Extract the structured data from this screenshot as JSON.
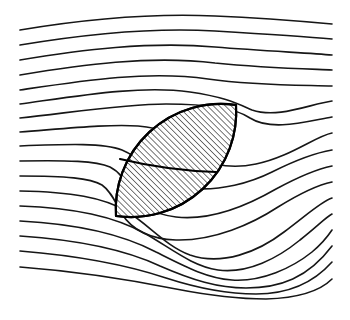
{
  "figure": {
    "title": "Streamlines deflected around an inclined hatched lens-shaped inclusion",
    "caption": "",
    "width_px": 350,
    "height_px": 320,
    "background_color": "#ffffff",
    "line_color": "#161616",
    "outline_color": "#000000",
    "hatch_color": "#141414"
  },
  "chart_data": {
    "type": "line",
    "title": "Streamlines deflected around an inclined hatched lens-shaped inclusion",
    "subtitle": "",
    "xlabel": "",
    "ylabel": "",
    "xlim": [
      0,
      350
    ],
    "ylim": [
      0,
      320
    ],
    "grid": false,
    "legend": false,
    "legend_position": "none",
    "axis_ticks": [],
    "annotations": [],
    "obstacle": {
      "name": "hatched-lens-inclusion",
      "shape": "lens (two circular arcs) inclined about 55 degrees from horizontal",
      "fill_pattern": "45-degree diagonal hatching, descending left-to-right",
      "hatch_angle_deg": -45,
      "hatch_spacing_px": 4.2,
      "tip_lower_left": [
        116,
        216
      ],
      "tip_upper_right": [
        236,
        105
      ],
      "internal_chord_from": [
        120,
        159
      ],
      "internal_chord_to": [
        216,
        172
      ]
    },
    "series": [
      {
        "name": "streamline-1",
        "left_y": 30,
        "right_y": 24,
        "path": "M 20,30 C 80,20 150,13 215,16 C 265,18 310,22 332,24"
      },
      {
        "name": "streamline-2",
        "left_y": 45,
        "right_y": 39,
        "path": "M 20,45 C 80,35 150,27 215,31 C 265,34 310,37 332,39"
      },
      {
        "name": "streamline-3",
        "left_y": 60,
        "right_y": 55,
        "path": "M 20,60 C 80,50 150,41 215,47 C 265,51 310,53 332,55"
      },
      {
        "name": "streamline-4",
        "left_y": 75,
        "right_y": 70,
        "path": "M 20,75 C 80,65 150,55 215,63 C 265,68 310,69 332,70"
      },
      {
        "name": "streamline-5",
        "left_y": 90,
        "right_y": 86,
        "path": "M 20,90 C 80,81 148,70 208,79 C 258,86 308,85 332,86"
      },
      {
        "name": "streamline-6",
        "left_y": 104,
        "right_y": 101,
        "path": "M 20,104 C 78,96 140,85 190,92 C 225,97 238,104 252,110 C 278,119 310,104 332,101"
      },
      {
        "name": "streamline-7",
        "left_y": 118,
        "right_y": 117,
        "path": "M 20,118 C 75,112 126,104 166,104 C 200,104 234,107 250,118 C 272,132 308,121 332,117"
      },
      {
        "name": "streamline-8",
        "left_y": 132,
        "right_y": 133,
        "path": "M 20,132 C 72,128 110,124 138,126 C 162,128 178,135 186,146 C 200,164 228,170 256,164 C 290,157 316,136 332,133"
      },
      {
        "name": "streamline-9",
        "left_y": 146,
        "right_y": 150,
        "path": "M 20,146 C 70,144 104,143 122,150 C 134,155 140,161 144,166 C 152,176 168,186 188,188 C 220,192 252,182 272,172 C 298,159 320,152 332,150"
      },
      {
        "name": "streamline-10",
        "left_y": 161,
        "right_y": 166,
        "path": "M 20,161 C 68,160 96,161 110,167 C 120,172 124,180 128,188 C 136,204 152,214 176,217 C 212,221 250,204 276,189 C 302,175 322,168 332,166"
      },
      {
        "name": "streamline-11",
        "left_y": 176,
        "right_y": 182,
        "path": "M 20,176 C 66,176 90,178 102,185 C 112,192 116,204 122,214 C 132,230 150,239 176,240 C 214,241 252,224 278,207 C 304,191 322,184 332,182"
      },
      {
        "name": "streamline-12",
        "left_y": 191,
        "right_y": 198,
        "path": "M 20,191 C 70,192 104,197 128,212 C 150,226 166,246 190,255 C 222,266 258,252 284,232 C 308,214 322,201 332,198"
      },
      {
        "name": "streamline-13",
        "left_y": 206,
        "right_y": 214,
        "path": "M 20,206 C 74,208 114,216 146,234 C 172,249 192,266 218,270 C 248,274 278,258 300,240 C 318,226 326,217 332,214"
      },
      {
        "name": "streamline-14",
        "left_y": 221,
        "right_y": 230,
        "path": "M 20,221 C 78,224 122,234 156,252 C 184,266 206,278 232,280 C 262,282 292,268 312,252 C 324,242 330,233 332,230"
      },
      {
        "name": "streamline-15",
        "left_y": 236,
        "right_y": 246,
        "path": "M 20,236 C 80,240 126,250 160,266 C 192,280 218,288 246,288 C 280,288 308,278 332,246"
      },
      {
        "name": "streamline-16",
        "left_y": 251,
        "right_y": 262,
        "path": "M 20,251 C 82,256 130,266 166,278 C 200,289 228,294 256,294 C 292,294 316,280 332,262"
      },
      {
        "name": "streamline-17",
        "left_y": 267,
        "right_y": 279,
        "path": "M 20,267 C 86,272 136,281 176,289 C 212,296 240,299 266,299 C 298,298 320,291 332,279"
      }
    ]
  }
}
